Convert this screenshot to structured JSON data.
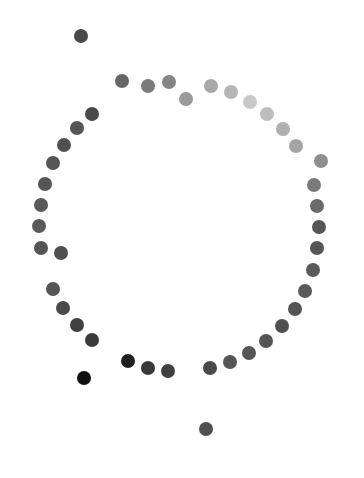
{
  "canvas": {
    "width": 364,
    "height": 478,
    "background": "#ffffff"
  },
  "dot_diameter": 14,
  "dots": [
    {
      "x": 81,
      "y": 36,
      "color": "#4a4a4a",
      "group": "outlier"
    },
    {
      "x": 122,
      "y": 81,
      "color": "#666666",
      "group": "ring"
    },
    {
      "x": 148,
      "y": 86,
      "color": "#7a7a7a",
      "group": "ring"
    },
    {
      "x": 169,
      "y": 82,
      "color": "#858585",
      "group": "ring"
    },
    {
      "x": 186,
      "y": 99,
      "color": "#9a9a9a",
      "group": "ring"
    },
    {
      "x": 211,
      "y": 86,
      "color": "#a8a8a8",
      "group": "ring"
    },
    {
      "x": 231,
      "y": 92,
      "color": "#b5b5b5",
      "group": "ring"
    },
    {
      "x": 250,
      "y": 102,
      "color": "#c8c8c8",
      "group": "ring"
    },
    {
      "x": 267,
      "y": 114,
      "color": "#bdbdbd",
      "group": "ring"
    },
    {
      "x": 283,
      "y": 129,
      "color": "#b0b0b0",
      "group": "ring"
    },
    {
      "x": 296,
      "y": 146,
      "color": "#a5a5a5",
      "group": "ring"
    },
    {
      "x": 321,
      "y": 161,
      "color": "#8e8e8e",
      "group": "ring"
    },
    {
      "x": 314,
      "y": 185,
      "color": "#7a7a7a",
      "group": "ring"
    },
    {
      "x": 317,
      "y": 206,
      "color": "#6a6a6a",
      "group": "ring"
    },
    {
      "x": 319,
      "y": 227,
      "color": "#555555",
      "group": "ring"
    },
    {
      "x": 317,
      "y": 248,
      "color": "#555555",
      "group": "ring"
    },
    {
      "x": 313,
      "y": 270,
      "color": "#5a5a5a",
      "group": "ring"
    },
    {
      "x": 305,
      "y": 291,
      "color": "#5a5a5a",
      "group": "ring"
    },
    {
      "x": 295,
      "y": 309,
      "color": "#555555",
      "group": "ring"
    },
    {
      "x": 282,
      "y": 326,
      "color": "#505050",
      "group": "ring"
    },
    {
      "x": 266,
      "y": 341,
      "color": "#555555",
      "group": "ring"
    },
    {
      "x": 249,
      "y": 353,
      "color": "#555555",
      "group": "ring"
    },
    {
      "x": 230,
      "y": 362,
      "color": "#555555",
      "group": "ring"
    },
    {
      "x": 210,
      "y": 368,
      "color": "#4a4a4a",
      "group": "ring"
    },
    {
      "x": 168,
      "y": 371,
      "color": "#404040",
      "group": "ring"
    },
    {
      "x": 148,
      "y": 368,
      "color": "#383838",
      "group": "ring"
    },
    {
      "x": 128,
      "y": 361,
      "color": "#202020",
      "group": "ring"
    },
    {
      "x": 84,
      "y": 378,
      "color": "#111111",
      "group": "outlier"
    },
    {
      "x": 206,
      "y": 429,
      "color": "#505050",
      "group": "outlier"
    },
    {
      "x": 92,
      "y": 114,
      "color": "#4a4a4a",
      "group": "ring"
    },
    {
      "x": 77,
      "y": 128,
      "color": "#555555",
      "group": "ring"
    },
    {
      "x": 64,
      "y": 145,
      "color": "#505050",
      "group": "ring"
    },
    {
      "x": 53,
      "y": 163,
      "color": "#555555",
      "group": "ring"
    },
    {
      "x": 45,
      "y": 184,
      "color": "#555555",
      "group": "ring"
    },
    {
      "x": 41,
      "y": 205,
      "color": "#5a5a5a",
      "group": "ring"
    },
    {
      "x": 39,
      "y": 226,
      "color": "#5a5a5a",
      "group": "ring"
    },
    {
      "x": 41,
      "y": 248,
      "color": "#555555",
      "group": "ring"
    },
    {
      "x": 61,
      "y": 253,
      "color": "#4f4f4f",
      "group": "ring"
    },
    {
      "x": 53,
      "y": 289,
      "color": "#555555",
      "group": "ring"
    },
    {
      "x": 63,
      "y": 308,
      "color": "#4a4a4a",
      "group": "ring"
    },
    {
      "x": 77,
      "y": 325,
      "color": "#404040",
      "group": "ring"
    },
    {
      "x": 92,
      "y": 340,
      "color": "#3a3a3a",
      "group": "ring"
    }
  ]
}
